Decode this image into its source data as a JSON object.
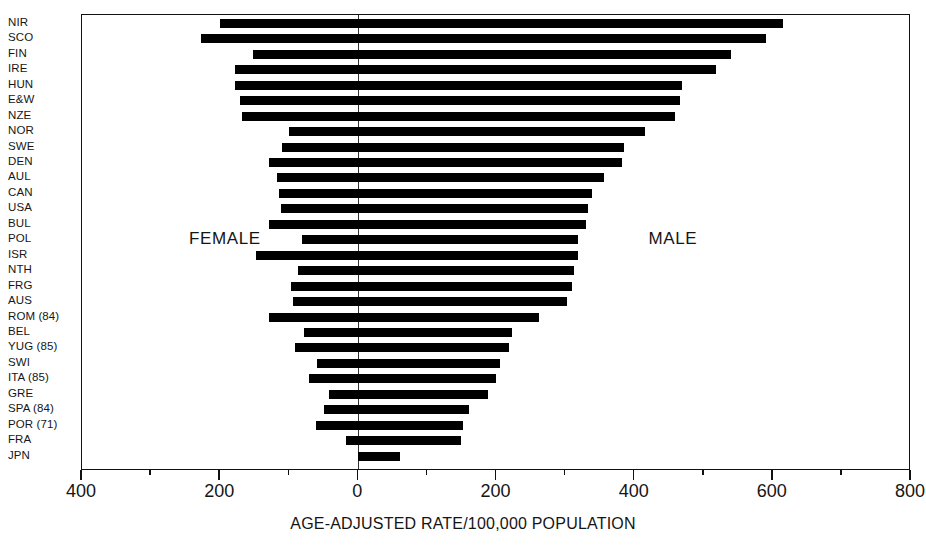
{
  "chart_data": {
    "type": "bar",
    "orientation": "horizontal",
    "title": "",
    "xlabel": "AGE-ADJUSTED RATE/100,000 POPULATION",
    "ylabel": "",
    "xlim": [
      -400,
      800
    ],
    "xticks": [
      -400,
      -200,
      0,
      200,
      400,
      600,
      800
    ],
    "xtick_labels": [
      "400",
      "200",
      "0",
      "200",
      "400",
      "600",
      "800"
    ],
    "minor_xticks": [
      -300,
      -100,
      100,
      300,
      500,
      700
    ],
    "grid": false,
    "legend": false,
    "annotations": [
      {
        "text": "FEMALE",
        "x": -245,
        "y_row": 14
      },
      {
        "text": "MALE",
        "x": 420,
        "y_row": 14
      }
    ],
    "note": "Paired horizontal bars: each bar spans from the female rate (negative / left of zero) to the male rate (positive / right of zero).",
    "categories": [
      "NIR",
      "SCO",
      "FIN",
      "IRE",
      "HUN",
      "E&W",
      "NZE",
      "NOR",
      "SWE",
      "DEN",
      "AUL",
      "CAN",
      "USA",
      "BUL",
      "POL",
      "ISR",
      "NTH",
      "FRG",
      "AUS",
      "ROM (84)",
      "BEL",
      "YUG (85)",
      "SWI",
      "ITA (85)",
      "GRE",
      "SPA (84)",
      "POR (71)",
      "FRA",
      "JPN"
    ],
    "series": [
      {
        "name": "FEMALE",
        "values": [
          200,
          228,
          152,
          178,
          178,
          172,
          168,
          100,
          110,
          130,
          118,
          115,
          112,
          130,
          82,
          148,
          88,
          98,
          95,
          130,
          78,
          92,
          60,
          72,
          42,
          50,
          62,
          18,
          0
        ]
      },
      {
        "name": "MALE",
        "values": [
          615,
          590,
          540,
          518,
          468,
          465,
          458,
          415,
          385,
          382,
          355,
          338,
          333,
          330,
          318,
          318,
          312,
          310,
          302,
          262,
          222,
          218,
          205,
          200,
          188,
          160,
          152,
          148,
          60
        ]
      }
    ]
  },
  "axis": {
    "title": "AGE-ADJUSTED RATE/100,000 POPULATION"
  },
  "labels": {
    "female": "FEMALE",
    "male": "MALE"
  }
}
